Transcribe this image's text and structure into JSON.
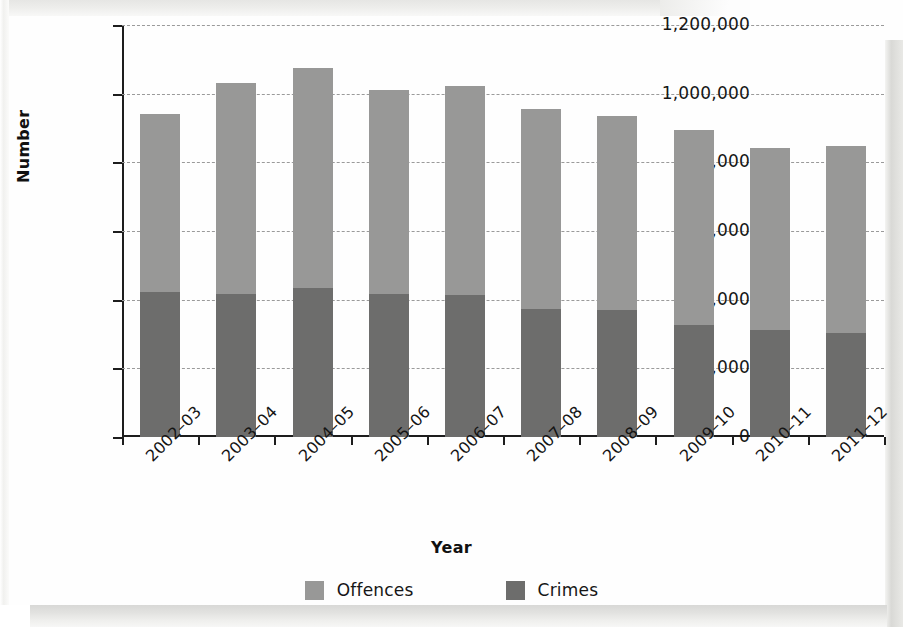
{
  "chart_data": {
    "type": "bar",
    "subtype": "stacked-bar",
    "title": "",
    "xlabel": "Year",
    "ylabel": "Number",
    "ylim": [
      0,
      1200000
    ],
    "ytick_interval": 200000,
    "grid": true,
    "legend_position": "bottom",
    "categories": [
      "2002–03",
      "2003–04",
      "2004–05",
      "2005–06",
      "2006–07",
      "2007–08",
      "2008–09",
      "2009–10",
      "2010–11",
      "2011–12"
    ],
    "ytick_labels": [
      "1,200,000",
      "1,000,000",
      "800,000",
      "600,000",
      "400,000",
      "200,000",
      "0"
    ],
    "ytick_values": [
      1200000,
      1000000,
      800000,
      600000,
      400000,
      200000,
      0
    ],
    "series": [
      {
        "name": "Crimes",
        "color": "#6d6d6c",
        "stack_order": 0,
        "values": [
          423000,
          418000,
          434000,
          418000,
          415000,
          372000,
          370000,
          325000,
          313000,
          304000
        ]
      },
      {
        "name": "Offences",
        "color": "#989897",
        "stack_order": 1,
        "values": [
          517000,
          614000,
          640000,
          594000,
          607000,
          582000,
          564000,
          568000,
          530000,
          544000
        ]
      }
    ],
    "totals": [
      940000,
      1032000,
      1074000,
      1012000,
      1022000,
      954000,
      934000,
      893000,
      843000,
      848000
    ]
  },
  "axes": {
    "y_title": "Number",
    "x_title": "Year"
  },
  "legend": {
    "items": [
      {
        "label": "Offences",
        "color": "#989897"
      },
      {
        "label": "Crimes",
        "color": "#6d6d6c"
      }
    ]
  }
}
